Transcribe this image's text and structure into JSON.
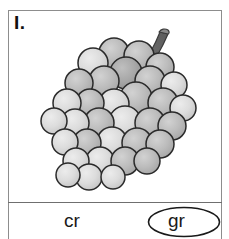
{
  "card": {
    "item_label": "I.",
    "border_color": "#8d8d8d",
    "divider_color": "#6f6f6f",
    "background": "#ffffff"
  },
  "illustration": {
    "name": "grape-cluster",
    "description": "grapes",
    "stem_color": "#6b6b6b",
    "outline_color": "#2a2a2a",
    "grape_fill_mid": "#b9b9b9",
    "grape_fill_light": "#d9d9d9",
    "grape_fill_dark": "#a0a0a0"
  },
  "answers": {
    "options": [
      {
        "id": "cr",
        "label": "cr",
        "selected": false
      },
      {
        "id": "gr",
        "label": "gr",
        "selected": true
      }
    ],
    "left_label": "cr",
    "right_label": "gr",
    "selection_mark": "ellipse"
  }
}
